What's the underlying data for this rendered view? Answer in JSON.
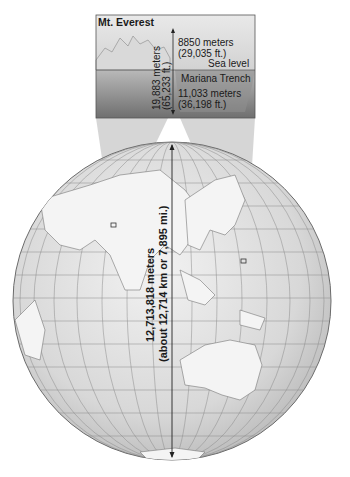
{
  "inset": {
    "title": "Mt. Everest",
    "everest_height_m": "8850 meters",
    "everest_height_ft": "(29,035 ft.)",
    "sea_level": "Sea level",
    "trench_name": "Mariana Trench",
    "trench_depth_m": "11,033 meters",
    "trench_depth_ft": "(36,198 ft.)",
    "total_relief_m": "19,883 meters",
    "total_relief_ft": "(65,233 ft.)"
  },
  "globe": {
    "diameter_m": "12,713,818 meters",
    "diameter_alt": "(about 12,714 km or 7,895 mi.)"
  }
}
